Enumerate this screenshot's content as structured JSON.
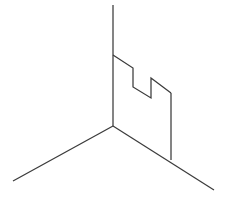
{
  "figure": {
    "title": "Isometric corner wall line drawing",
    "background_color": "#ffffff",
    "stroke_color": "#3b3b3b",
    "stroke_width": 1.25,
    "canvas": {
      "width": 225,
      "height": 210
    },
    "vertices": {
      "corner_top": [
        113,
        5
      ],
      "corner_step": [
        113,
        55
      ],
      "corner_bottom": [
        113,
        126
      ],
      "ground_left_end": [
        13,
        181
      ],
      "ground_right_end": [
        214,
        190
      ],
      "wall_right_top": [
        171,
        93
      ],
      "wall_right_bottom": [
        171,
        160
      ],
      "crenel_1_top_right": [
        133,
        68
      ],
      "crenel_1_bottom": [
        133,
        87
      ],
      "crenel_2_valley": [
        151,
        98
      ],
      "crenel_2_top": [
        151,
        78
      ]
    },
    "paths": [
      {
        "name": "vertical-corner-edge",
        "label": "Vertical corner edge",
        "d": "M 113 5 L 113 126"
      },
      {
        "name": "ground-line-left",
        "label": "Left ground line",
        "d": "M 113 126 L 13 181"
      },
      {
        "name": "ground-line-right",
        "label": "Right ground line",
        "d": "M 113 126 L 214 190"
      },
      {
        "name": "crenellated-top-profile",
        "label": "Crenellated top profile of wall",
        "d": "M 113 55 L 133 68 L 133 87 L 151 98 L 151 78 L 171 93"
      },
      {
        "name": "wall-right-vertical-edge",
        "label": "Right vertical edge of wall",
        "d": "M 171 93 L 171 160"
      }
    ],
    "path_count": 5
  }
}
